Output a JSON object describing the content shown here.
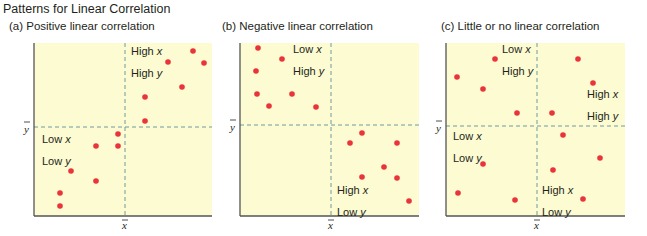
{
  "title": "Patterns for Linear Correlation",
  "colors": {
    "background": "#fdfbd2",
    "dot": "#e8343a",
    "mean_line": "#6f9aa3",
    "axis": "#555555"
  },
  "chart_data": [
    {
      "type": "scatter",
      "id": "a",
      "title": "(a)  Positive linear correlation",
      "xlabel": "x̄",
      "ylabel": "ȳ",
      "quadrant_labels": [
        {
          "lines": [
            "High x",
            "High y"
          ],
          "quadrant": "upper-right"
        },
        {
          "lines": [
            "Low x",
            "Low y"
          ],
          "quadrant": "lower-left"
        }
      ],
      "frame": {
        "left": 34,
        "top": 43,
        "right": 212,
        "bottom": 216
      },
      "mean": {
        "x": 125,
        "y": 127
      },
      "points": [
        [
          193,
          51
        ],
        [
          168,
          62
        ],
        [
          204,
          63
        ],
        [
          182,
          87
        ],
        [
          145,
          97
        ],
        [
          145,
          121
        ],
        [
          118,
          134
        ],
        [
          96,
          146
        ],
        [
          118,
          146
        ],
        [
          71,
          171
        ],
        [
          96,
          181
        ],
        [
          60,
          193
        ],
        [
          60,
          206
        ]
      ]
    },
    {
      "type": "scatter",
      "id": "b",
      "title": "(b)  Negative linear correlation",
      "xlabel": "x̄",
      "ylabel": "ȳ",
      "quadrant_labels": [
        {
          "lines": [
            "Low x",
            "High y"
          ],
          "quadrant": "upper-left"
        },
        {
          "lines": [
            "High x",
            "Low y"
          ],
          "quadrant": "lower-right"
        }
      ],
      "frame": {
        "left": 240,
        "top": 43,
        "right": 419,
        "bottom": 216
      },
      "mean": {
        "x": 331,
        "y": 125
      },
      "points": [
        [
          258,
          48
        ],
        [
          282,
          59
        ],
        [
          256,
          71
        ],
        [
          257,
          94
        ],
        [
          292,
          94
        ],
        [
          269,
          106
        ],
        [
          316,
          107
        ],
        [
          362,
          133
        ],
        [
          350,
          143
        ],
        [
          397,
          143
        ],
        [
          384,
          167
        ],
        [
          362,
          177
        ],
        [
          397,
          178
        ],
        [
          409,
          201
        ]
      ]
    },
    {
      "type": "scatter",
      "id": "c",
      "title": "(c)  Little or no linear correlation",
      "xlabel": "x̄",
      "ylabel": "ȳ",
      "quadrant_labels": [
        {
          "lines": [
            "Low x",
            "High y"
          ],
          "quadrant": "upper-left"
        },
        {
          "lines": [
            "High x",
            "High y"
          ],
          "quadrant": "upper-right"
        },
        {
          "lines": [
            "Low x",
            "Low y"
          ],
          "quadrant": "lower-left"
        },
        {
          "lines": [
            "High x",
            "Low y"
          ],
          "quadrant": "lower-right"
        }
      ],
      "frame": {
        "left": 446,
        "top": 43,
        "right": 625,
        "bottom": 216
      },
      "mean": {
        "x": 537,
        "y": 126
      },
      "points": [
        [
          495,
          59
        ],
        [
          578,
          59
        ],
        [
          457,
          77
        ],
        [
          593,
          83
        ],
        [
          483,
          89
        ],
        [
          517,
          113
        ],
        [
          552,
          113
        ],
        [
          563,
          135
        ],
        [
          600,
          158
        ],
        [
          483,
          164
        ],
        [
          553,
          170
        ],
        [
          458,
          193
        ],
        [
          515,
          200
        ],
        [
          583,
          199
        ]
      ]
    }
  ],
  "panels": {
    "a": {
      "title": "(a)  Positive linear correlation",
      "ur": [
        "High x",
        "High y"
      ],
      "ll": [
        "Low x",
        "Low y"
      ]
    },
    "b": {
      "title": "(b)  Negative linear correlation",
      "ul": [
        "Low x",
        "High y"
      ],
      "lr": [
        "High x",
        "Low y"
      ]
    },
    "c": {
      "title": "(c)  Little or no linear correlation",
      "ul": [
        "Low x",
        "High y"
      ],
      "ur": [
        "High x",
        "High y"
      ],
      "ll": [
        "Low x",
        "Low y"
      ],
      "lr": [
        "High x",
        "Low y"
      ]
    }
  },
  "axis_symbols": {
    "xbar": "x",
    "ybar": "y"
  }
}
